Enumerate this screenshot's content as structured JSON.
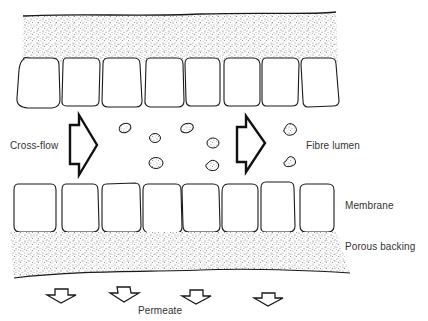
{
  "diagram": {
    "type": "cross-flow membrane filtration schematic",
    "labels": {
      "cross_flow": "Cross-flow",
      "fibre_lumen": "Fibre lumen",
      "membrane": "Membrane",
      "porous_backing": "Porous backing",
      "permeate": "Permeate"
    },
    "components": {
      "top_porous_layer": "stippled porous backing (top)",
      "top_membrane_cells": 8,
      "bottom_membrane_cells": 8,
      "bottom_porous_layer": "stippled porous backing (bottom)",
      "particles": 8,
      "cross_flow_arrows": 2,
      "permeate_arrows": 4
    },
    "colors": {
      "line": "#1a1a1a",
      "stipple": "#9a9a9a",
      "text": "#333333",
      "background": "#ffffff"
    }
  }
}
